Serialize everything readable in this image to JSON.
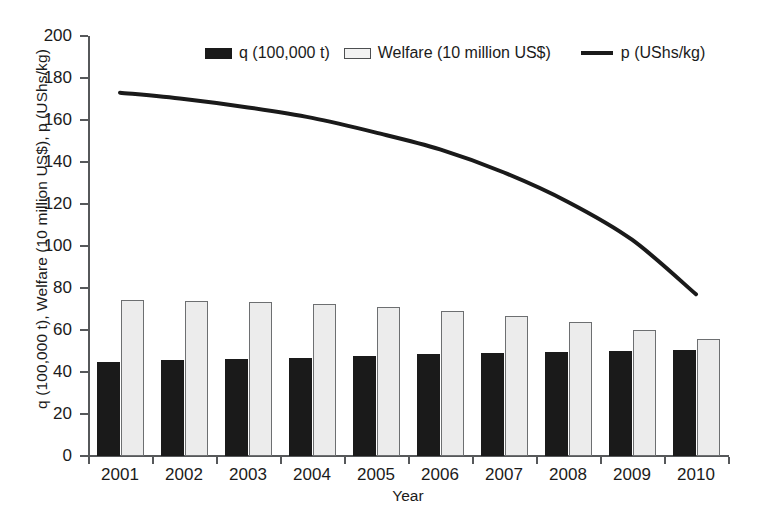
{
  "chart_data": {
    "type": "bar",
    "title": "",
    "xlabel": "Year",
    "ylabel": "q (100,000 t), Welfare (10 million US$), p (UShs/kg)",
    "categories": [
      "2001",
      "2002",
      "2003",
      "2004",
      "2005",
      "2006",
      "2007",
      "2008",
      "2009",
      "2010"
    ],
    "ylim": [
      0,
      200
    ],
    "y_ticks": [
      0,
      20,
      40,
      60,
      80,
      100,
      120,
      140,
      160,
      180,
      200
    ],
    "grid": false,
    "legend_position": "top-center",
    "series": [
      {
        "name": "q (100,000 t)",
        "type": "bar",
        "color": "#1a1a1a",
        "values": [
          45,
          45.5,
          46,
          46.5,
          47.5,
          48.5,
          49,
          49.5,
          50,
          50.5
        ]
      },
      {
        "name": "Welfare (10 million US$)",
        "type": "bar",
        "color": "#ececec",
        "values": [
          74.5,
          74,
          73.5,
          72.5,
          71,
          69,
          66.5,
          64,
          60,
          55.5
        ]
      },
      {
        "name": "p (UShs/kg)",
        "type": "line",
        "color": "#1a1a1a",
        "values": [
          173,
          170,
          166,
          161,
          154,
          146,
          135,
          121,
          103,
          77
        ]
      }
    ]
  },
  "legend": {
    "items": [
      {
        "label": "q (100,000 t)",
        "marker": "bar-dark-swatch"
      },
      {
        "label": "Welfare (10 million US$)",
        "marker": "bar-light-swatch"
      },
      {
        "label": "p (UShs/kg)",
        "marker": "line-swatch"
      }
    ]
  }
}
